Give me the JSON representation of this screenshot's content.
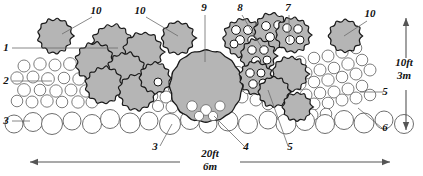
{
  "figure": {
    "background_color": "#ffffff",
    "clast_fill": "#b5b5b5",
    "clast_stroke": "#1a1a1a",
    "circle_stroke": "#6e6e6e",
    "circle_fill": "#ffffff",
    "leader_color": "#6b6b6b",
    "text_color": "#111111"
  },
  "callouts": [
    {
      "id": "c1",
      "text": "10",
      "x": 96,
      "y": 14,
      "leader": [
        [
          92,
          17
        ],
        [
          62,
          34
        ]
      ]
    },
    {
      "id": "c2",
      "text": "10",
      "x": 140,
      "y": 14,
      "leader": [
        [
          146,
          17
        ],
        [
          178,
          36
        ]
      ]
    },
    {
      "id": "c3",
      "text": "9",
      "x": 204,
      "y": 11,
      "leader": [
        [
          205,
          15
        ],
        [
          205,
          62
        ]
      ]
    },
    {
      "id": "c4",
      "text": "8",
      "x": 240,
      "y": 11,
      "leader": [
        [
          242,
          15
        ],
        [
          262,
          48
        ]
      ]
    },
    {
      "id": "c5",
      "text": "7",
      "x": 288,
      "y": 11,
      "leader": [
        [
          289,
          15
        ],
        [
          289,
          42
        ]
      ]
    },
    {
      "id": "c6",
      "text": "10",
      "x": 370,
      "y": 17,
      "leader": [
        [
          367,
          21
        ],
        [
          344,
          36
        ]
      ]
    },
    {
      "id": "c7",
      "text": "1",
      "x": 6,
      "y": 51,
      "leader": [
        [
          12,
          48
        ],
        [
          118,
          48
        ]
      ]
    },
    {
      "id": "c8",
      "text": "2",
      "x": 6,
      "y": 84,
      "leader": [
        [
          12,
          81
        ],
        [
          52,
          81
        ]
      ]
    },
    {
      "id": "c9",
      "text": "3",
      "x": 6,
      "y": 124,
      "leader": [
        [
          12,
          121
        ],
        [
          30,
          121
        ]
      ]
    },
    {
      "id": "c10",
      "text": "5",
      "x": 385,
      "y": 95,
      "leader": [
        [
          383,
          92
        ],
        [
          360,
          92
        ]
      ]
    },
    {
      "id": "c11",
      "text": "6",
      "x": 385,
      "y": 131,
      "leader": [
        [
          382,
          128
        ],
        [
          358,
          108
        ]
      ]
    },
    {
      "id": "c12",
      "text": "3",
      "x": 155,
      "y": 150,
      "leader": [
        [
          160,
          146
        ],
        [
          172,
          124
        ]
      ]
    },
    {
      "id": "c13",
      "text": "4",
      "x": 246,
      "y": 150,
      "leader": [
        [
          244,
          146
        ],
        [
          214,
          116
        ]
      ]
    },
    {
      "id": "c14",
      "text": "5",
      "x": 290,
      "y": 150,
      "leader": [
        [
          288,
          146
        ],
        [
          268,
          90
        ]
      ]
    }
  ],
  "dimensions": {
    "horizontal": {
      "line1": "20ft",
      "line2": "6m",
      "x": 210,
      "y1": 157,
      "y2": 170
    },
    "vertical": {
      "line1": "10ft",
      "line2": "3m",
      "x": 404,
      "y1": 66,
      "y2": 79
    }
  },
  "chart_data": {
    "type": "diagram",
    "legend_keys": [
      "1",
      "2",
      "3",
      "4",
      "5",
      "6",
      "7",
      "8",
      "9",
      "10"
    ],
    "scale_horizontal": "20ft / 6m",
    "scale_vertical": "10ft / 3m",
    "gravel_small_circles": [
      [
        24,
        66,
        6.0
      ],
      [
        40,
        64,
        6.2
      ],
      [
        55,
        65,
        6.0
      ],
      [
        70,
        64,
        6.4
      ],
      [
        86,
        66,
        5.6
      ],
      [
        17,
        78,
        6.2
      ],
      [
        33,
        77,
        6.0
      ],
      [
        48,
        79,
        6.4
      ],
      [
        64,
        78,
        5.8
      ],
      [
        79,
        79,
        6.2
      ],
      [
        24,
        90,
        6.4
      ],
      [
        40,
        90,
        5.8
      ],
      [
        56,
        91,
        6.2
      ],
      [
        71,
        90,
        6.0
      ],
      [
        86,
        91,
        6.2
      ],
      [
        17,
        101,
        5.8
      ],
      [
        32,
        102,
        6.0
      ],
      [
        47,
        101,
        6.2
      ],
      [
        62,
        102,
        5.8
      ],
      [
        78,
        102,
        6.2
      ],
      [
        94,
        79,
        6.0
      ],
      [
        100,
        92,
        5.6
      ],
      [
        92,
        102,
        6.0
      ],
      [
        160,
        85,
        6.0
      ],
      [
        174,
        88,
        5.8
      ],
      [
        188,
        86,
        6.2
      ],
      [
        166,
        97,
        6.0
      ],
      [
        180,
        98,
        6.0
      ],
      [
        152,
        96,
        5.8
      ],
      [
        196,
        96,
        6.0
      ],
      [
        158,
        106,
        5.6
      ],
      [
        172,
        107,
        6.0
      ],
      [
        186,
        107,
        5.8
      ],
      [
        200,
        106,
        6.0
      ],
      [
        214,
        104,
        6.2
      ],
      [
        228,
        100,
        5.8
      ],
      [
        242,
        97,
        6.0
      ],
      [
        236,
        86,
        6.0
      ],
      [
        248,
        88,
        5.8
      ],
      [
        250,
        76,
        6.0
      ],
      [
        238,
        72,
        5.6
      ],
      [
        256,
        100,
        6.0
      ],
      [
        268,
        104,
        5.8
      ],
      [
        300,
        62,
        6.0
      ],
      [
        314,
        58,
        5.8
      ],
      [
        328,
        56,
        6.0
      ],
      [
        342,
        52,
        6.2
      ],
      [
        356,
        48,
        5.8
      ],
      [
        306,
        73,
        6.0
      ],
      [
        320,
        70,
        6.0
      ],
      [
        334,
        68,
        5.8
      ],
      [
        348,
        64,
        6.2
      ],
      [
        362,
        60,
        5.8
      ],
      [
        300,
        84,
        6.0
      ],
      [
        314,
        82,
        5.8
      ],
      [
        328,
        80,
        6.2
      ],
      [
        342,
        77,
        5.8
      ],
      [
        356,
        74,
        6.0
      ],
      [
        370,
        70,
        6.0
      ],
      [
        306,
        95,
        6.0
      ],
      [
        320,
        93,
        5.8
      ],
      [
        334,
        92,
        6.0
      ],
      [
        348,
        89,
        6.0
      ],
      [
        362,
        86,
        5.8
      ],
      [
        300,
        106,
        5.8
      ],
      [
        314,
        104,
        6.0
      ],
      [
        328,
        103,
        5.8
      ],
      [
        342,
        100,
        6.0
      ],
      [
        356,
        98,
        6.0
      ],
      [
        370,
        95,
        5.8
      ],
      [
        312,
        115,
        6.0
      ],
      [
        326,
        114,
        5.8
      ]
    ],
    "cobble_large_circles": [
      [
        33,
        122,
        9.5
      ],
      [
        52,
        124,
        10.5
      ],
      [
        72,
        121,
        9.0
      ],
      [
        92,
        124,
        9.5
      ],
      [
        110,
        119,
        9.5
      ],
      [
        130,
        123,
        10.0
      ],
      [
        149,
        121,
        9.0
      ],
      [
        170,
        124,
        10.5
      ],
      [
        190,
        120,
        9.5
      ],
      [
        208,
        124,
        9.0
      ],
      [
        228,
        121,
        10.0
      ],
      [
        248,
        124,
        9.5
      ],
      [
        268,
        120,
        9.0
      ],
      [
        286,
        124,
        10.0
      ],
      [
        305,
        121,
        9.5
      ],
      [
        325,
        124,
        9.5
      ],
      [
        344,
        120,
        9.5
      ],
      [
        364,
        123,
        10.0
      ],
      [
        384,
        120,
        9.0
      ],
      [
        404,
        124,
        9.5
      ],
      [
        14,
        124,
        9.0
      ]
    ],
    "boulder": {
      "cx": 206,
      "cy": 86,
      "r": 36
    },
    "clast_clusters": [
      {
        "label": "10",
        "cx": 55,
        "cy": 36,
        "r": 17,
        "bumps": 13,
        "inner_circles": []
      },
      {
        "label": "10",
        "cx": 178,
        "cy": 38,
        "r": 16,
        "bumps": 12,
        "inner_circles": []
      },
      {
        "label": "10",
        "cx": 345,
        "cy": 36,
        "r": 16,
        "bumps": 12,
        "inner_circles": []
      },
      {
        "label": "1",
        "cx": 112,
        "cy": 45,
        "r": 20,
        "bumps": 14,
        "inner_circles": []
      },
      {
        "label": "1",
        "cx": 143,
        "cy": 52,
        "r": 19,
        "bumps": 13,
        "inner_circles": []
      },
      {
        "label": "1",
        "cx": 95,
        "cy": 62,
        "r": 19,
        "bumps": 13,
        "inner_circles": []
      },
      {
        "label": "1",
        "cx": 126,
        "cy": 72,
        "r": 19,
        "bumps": 14,
        "inner_circles": []
      },
      {
        "label": "1",
        "cx": 104,
        "cy": 85,
        "r": 18,
        "bumps": 13,
        "inner_circles": []
      },
      {
        "label": "1",
        "cx": 137,
        "cy": 92,
        "r": 18,
        "bumps": 13,
        "inner_circles": []
      },
      {
        "label": "1",
        "cx": 155,
        "cy": 78,
        "r": 15,
        "bumps": 12,
        "inner_circles": [
          [
            158,
            82,
            4.0
          ]
        ]
      },
      {
        "label": "8",
        "cx": 243,
        "cy": 38,
        "r": 19,
        "bumps": 14,
        "inner_circles": [
          [
            236,
            30,
            4.4
          ],
          [
            248,
            30,
            4.4
          ],
          [
            240,
            40,
            4.4
          ],
          [
            252,
            40,
            4.2
          ],
          [
            234,
            44,
            4.0
          ]
        ]
      },
      {
        "label": "8",
        "cx": 272,
        "cy": 32,
        "r": 18,
        "bumps": 13,
        "inner_circles": [
          [
            266,
            26,
            4.4
          ],
          [
            278,
            25,
            4.2
          ],
          [
            270,
            37,
            4.4
          ],
          [
            281,
            36,
            4.2
          ]
        ]
      },
      {
        "label": "8",
        "cx": 258,
        "cy": 56,
        "r": 17,
        "bumps": 13,
        "inner_circles": [
          [
            252,
            50,
            4.2
          ],
          [
            264,
            50,
            4.2
          ],
          [
            256,
            61,
            4.4
          ],
          [
            267,
            60,
            4.0
          ]
        ]
      },
      {
        "label": "7",
        "cx": 293,
        "cy": 35,
        "r": 17,
        "bumps": 13,
        "inner_circles": [
          [
            287,
            28,
            4.2
          ],
          [
            298,
            29,
            4.2
          ],
          [
            290,
            40,
            4.4
          ],
          [
            300,
            40,
            4.0
          ]
        ]
      },
      {
        "label": "7",
        "cx": 256,
        "cy": 78,
        "r": 16,
        "bumps": 13,
        "inner_circles": [
          [
            250,
            73,
            4.2
          ],
          [
            261,
            73,
            4.0
          ],
          [
            253,
            84,
            4.2
          ],
          [
            263,
            83,
            4.0
          ]
        ]
      },
      {
        "label": "5",
        "cx": 290,
        "cy": 74,
        "r": 17,
        "bumps": 13,
        "inner_circles": []
      },
      {
        "label": "5",
        "cx": 274,
        "cy": 92,
        "r": 15,
        "bumps": 12,
        "inner_circles": []
      },
      {
        "label": "5",
        "cx": 297,
        "cy": 107,
        "r": 14,
        "bumps": 12,
        "inner_circles": []
      }
    ]
  }
}
